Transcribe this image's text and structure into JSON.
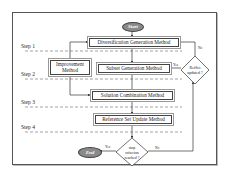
{
  "diagram": {
    "start_label": "Start",
    "end_label": "End",
    "steps": [
      "Step 1",
      "Step 2",
      "Step 3",
      "Step 4"
    ],
    "boxes": {
      "diversification": "Diversification Generation Method",
      "improvement_line1": "Improvement",
      "improvement_line2": "Method",
      "subset": "Subset Generation Method",
      "combination": "Solution Combination Method",
      "refset_update": "Reference Set  Update Method"
    },
    "decisions": {
      "refset_line1": "RefSet",
      "refset_line2": "updated ?",
      "stop_line1": "stop",
      "stop_line2": "criterion",
      "stop_line3": "reached ?"
    },
    "edge_labels": {
      "refset_no": "No",
      "refset_yes": "Yes",
      "stop_yes": "Yes",
      "stop_no": "No"
    },
    "colors": {
      "terminal_fill": "#8a8a8a",
      "line": "#444444",
      "frame": "#555555"
    }
  }
}
